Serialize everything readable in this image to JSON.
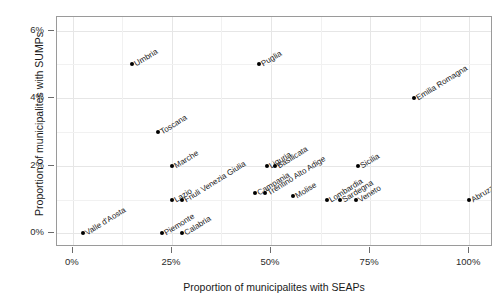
{
  "chart_data": {
    "type": "scatter",
    "title": "",
    "xlabel": "Proportion of municipalites with SEAPs",
    "ylabel": "Proportion of municipalites with SUMPs",
    "xlim": [
      -0.04,
      1.06
    ],
    "ylim": [
      -0.004,
      0.064
    ],
    "xticks": [
      "0%",
      "25%",
      "50%",
      "75%",
      "100%"
    ],
    "xtick_values": [
      0,
      0.25,
      0.5,
      0.75,
      1.0
    ],
    "yticks": [
      "0%",
      "2%",
      "4%",
      "6%"
    ],
    "ytick_values": [
      0,
      0.02,
      0.04,
      0.06
    ],
    "grid": true,
    "legend": "none",
    "point_color": "#000000",
    "panel_border_color": "#9a9a9a",
    "grid_color": "#e6e6e6",
    "points": [
      {
        "label": "Valle d'Aosta",
        "x": 0.025,
        "y": 0.0
      },
      {
        "label": "Piemonte",
        "x": 0.225,
        "y": 0.0
      },
      {
        "label": "Calabria",
        "x": 0.275,
        "y": 0.0
      },
      {
        "label": "Umbria",
        "x": 0.15,
        "y": 0.05
      },
      {
        "label": "Toscana",
        "x": 0.215,
        "y": 0.03
      },
      {
        "label": "Marche",
        "x": 0.25,
        "y": 0.02
      },
      {
        "label": "Lazio",
        "x": 0.25,
        "y": 0.01
      },
      {
        "label": "Friuli Venezia Giulia",
        "x": 0.275,
        "y": 0.01
      },
      {
        "label": "Puglia",
        "x": 0.47,
        "y": 0.05
      },
      {
        "label": "Liguria",
        "x": 0.49,
        "y": 0.02
      },
      {
        "label": "Basilicata",
        "x": 0.51,
        "y": 0.02
      },
      {
        "label": "Campania",
        "x": 0.46,
        "y": 0.012
      },
      {
        "label": "Trentino Alto Adige",
        "x": 0.485,
        "y": 0.012
      },
      {
        "label": "Molise",
        "x": 0.555,
        "y": 0.011
      },
      {
        "label": "Lombardia",
        "x": 0.64,
        "y": 0.01
      },
      {
        "label": "Sardegna",
        "x": 0.675,
        "y": 0.01
      },
      {
        "label": "Veneto",
        "x": 0.715,
        "y": 0.01
      },
      {
        "label": "Sicilia",
        "x": 0.72,
        "y": 0.02
      },
      {
        "label": "Emilia Romagna",
        "x": 0.86,
        "y": 0.04
      },
      {
        "label": "Abruzzo",
        "x": 1.0,
        "y": 0.01
      }
    ]
  }
}
